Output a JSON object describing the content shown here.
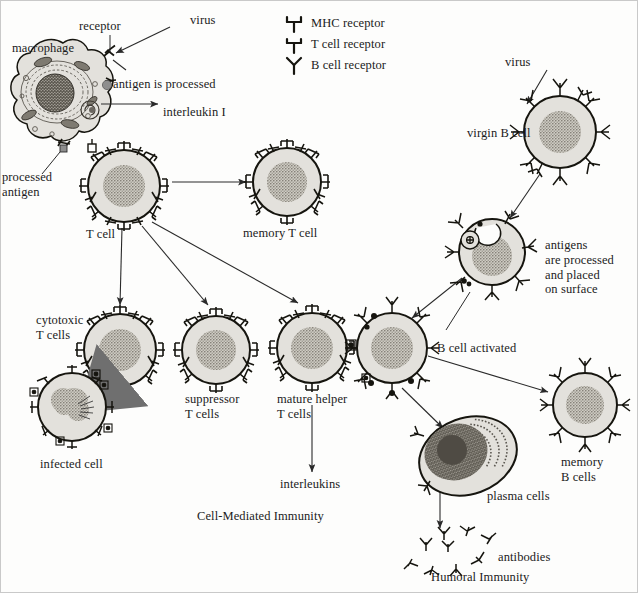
{
  "figure": {
    "background_color": "#fdfdfc",
    "cell_fill": "#e3e1dc",
    "cell_stroke": "#16150f",
    "nucleus_color": "#8a867e",
    "virus_color": "#8e8e8e",
    "arrow_color": "#2a2a2a",
    "kill_arrow_color": "#6f6f6f"
  },
  "legend": {
    "items": [
      {
        "icon": "mhc-receptor-icon",
        "label": "MHC receptor"
      },
      {
        "icon": "t-cell-receptor-icon",
        "label": "T cell receptor"
      },
      {
        "icon": "b-cell-receptor-icon",
        "label": "B cell receptor"
      }
    ]
  },
  "labels": {
    "receptor": "receptor",
    "virus_left": "virus",
    "macrophage": "macrophage",
    "antigen_processed": "antigen is processed",
    "interleukin_one": "interleukin I",
    "processed_antigen": "processed\nantigen",
    "t_cell": "T cell",
    "memory_t_cell": "memory T cell",
    "cytotoxic_t_cells": "cytotoxic\nT cells",
    "infected_cell": "infected cell",
    "suppressor_t_cells": "suppressor\nT cells",
    "mature_helper_t_cells": "mature helper\nT cells",
    "interleukins": "interleukins",
    "cell_mediated_immunity": "Cell-Mediated Immunity",
    "virus_right": "virus",
    "virgin_b_cell": "virgin B cell",
    "antigens_processed_surface": "antigens\nare processed\nand placed\non surface",
    "b_cell_activated": "B cell activated",
    "memory_b_cells": "memory\nB cells",
    "plasma_cells": "plasma cells",
    "antibodies": "antibodies",
    "humoral_immunity": "Humoral Immunity"
  },
  "cells": [
    {
      "name": "macrophage",
      "type": "macrophage",
      "receptor": "mhc",
      "cx": 62,
      "cy": 100
    },
    {
      "name": "t-cell",
      "type": "t-cell",
      "receptor": "t",
      "cx": 124,
      "cy": 186,
      "r": 36
    },
    {
      "name": "memory-t-cell",
      "type": "t-cell",
      "receptor": "t",
      "cx": 287,
      "cy": 182,
      "r": 34
    },
    {
      "name": "cytotoxic-t-cell",
      "type": "t-cell",
      "receptor": "t",
      "cx": 120,
      "cy": 350,
      "r": 36
    },
    {
      "name": "infected-cell",
      "type": "infected",
      "receptor": "mhc",
      "cx": 72,
      "cy": 407,
      "r": 34
    },
    {
      "name": "suppressor-t-cell",
      "type": "t-cell",
      "receptor": "t",
      "cx": 216,
      "cy": 350,
      "r": 34
    },
    {
      "name": "mature-helper-t-cell",
      "type": "t-cell",
      "receptor": "t",
      "cx": 312,
      "cy": 348,
      "r": 35
    },
    {
      "name": "activated-b-cell",
      "type": "b-cell",
      "receptor": "b",
      "cx": 392,
      "cy": 348,
      "r": 35
    },
    {
      "name": "virgin-b-cell",
      "type": "b-cell",
      "receptor": "b",
      "cx": 560,
      "cy": 132,
      "r": 36
    },
    {
      "name": "processing-b-cell",
      "type": "b-cell",
      "receptor": "b",
      "cx": 492,
      "cy": 252,
      "r": 33
    },
    {
      "name": "memory-b-cell",
      "type": "b-cell",
      "receptor": "b",
      "cx": 585,
      "cy": 405,
      "r": 32
    },
    {
      "name": "plasma-cell",
      "type": "plasma",
      "receptor": "b",
      "cx": 468,
      "cy": 456
    }
  ],
  "viruses": [
    {
      "name": "virus-particle-left",
      "cx": 178,
      "cy": 21
    },
    {
      "name": "virus-particle-right",
      "cx": 541,
      "cy": 63
    }
  ],
  "antibodies_cluster": {
    "count": 9,
    "cx": 466,
    "cy": 546
  }
}
